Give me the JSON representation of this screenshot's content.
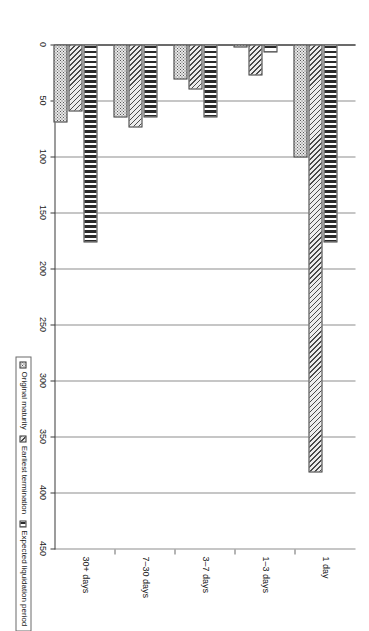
{
  "chart_data": {
    "type": "bar",
    "orientation": "horizontal-rotated",
    "title": "",
    "xlabel": "",
    "ylabel": "",
    "categories": [
      "1 day",
      "1–3 days",
      "3–7 days",
      "7–30 days",
      "30+ days"
    ],
    "series": [
      {
        "name": "Original maturity",
        "pattern": "dotted",
        "values": [
          101,
          3,
          31,
          65,
          70
        ]
      },
      {
        "name": "Earliest termination",
        "pattern": "diagonal-hatch",
        "values": [
          382,
          28,
          40,
          74,
          60
        ]
      },
      {
        "name": "Expected liquidation period",
        "pattern": "vertical-stripe",
        "values": [
          177,
          7,
          65,
          65,
          177
        ]
      }
    ],
    "axis": {
      "ticks": [
        0,
        50,
        100,
        150,
        200,
        250,
        300,
        350,
        400,
        450
      ],
      "tick_labels": [
        "0",
        "50",
        "100",
        "150",
        "200",
        "250",
        "300",
        "350",
        "400",
        "450"
      ],
      "limits": [
        0,
        450
      ],
      "grid": true
    },
    "legend": {
      "position": "bottom-right",
      "entries": [
        "Original maturity",
        "Earliest termination",
        "Expected liquidation period"
      ]
    },
    "colors": {
      "axis": "#3a3a3a",
      "grid": "#8d8d8d",
      "bar_outline": "#3a3a3a",
      "background": "#ffffff"
    }
  }
}
